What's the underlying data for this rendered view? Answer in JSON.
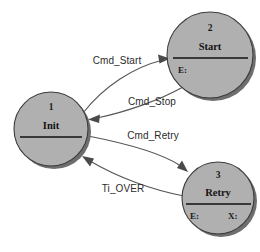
{
  "diagram": {
    "type": "state-machine",
    "title": "",
    "background_color": "#ffffff",
    "node_fill_color": "#b0b0b0",
    "node_stroke_color": "#3c3c3c",
    "edge_color": "#565656",
    "states": [
      {
        "id": "init",
        "number": "1",
        "name": "Init",
        "slots": [],
        "cx": 51,
        "cy": 129,
        "r": 37
      },
      {
        "id": "start",
        "number": "2",
        "name": "Start",
        "slots": [
          {
            "label": "E:",
            "position": "left"
          }
        ],
        "cx": 210,
        "cy": 55,
        "r": 43
      },
      {
        "id": "retry",
        "number": "3",
        "name": "Retry",
        "slots": [
          {
            "label": "E:",
            "position": "left"
          },
          {
            "label": "X:",
            "position": "right"
          }
        ],
        "cx": 218,
        "cy": 198,
        "r": 36
      }
    ],
    "transitions": [
      {
        "id": "init-to-start",
        "label": "Cmd_Start",
        "from": "init",
        "to": "start",
        "label_x": 117,
        "label_y": 64
      },
      {
        "id": "start-to-init",
        "label": "Cmd_Stop",
        "from": "start",
        "to": "init",
        "label_x": 152,
        "label_y": 105
      },
      {
        "id": "init-to-retry",
        "label": "Cmd_Retry",
        "from": "init",
        "to": "retry",
        "label_x": 153,
        "label_y": 139
      },
      {
        "id": "retry-to-init",
        "label": "Ti_OVER",
        "from": "retry",
        "to": "init",
        "label_x": 123,
        "label_y": 192
      }
    ]
  }
}
